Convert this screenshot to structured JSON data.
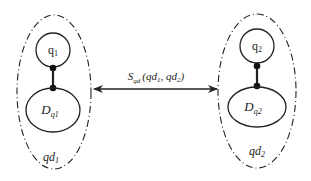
{
  "diagram": {
    "left_group": {
      "label_base": "qd",
      "label_sub": "1",
      "node_top": {
        "base": "q",
        "sub": "1"
      },
      "node_bottom": {
        "base": "D",
        "sub": "q1"
      }
    },
    "right_group": {
      "label_base": "qd",
      "label_sub": "2",
      "node_top": {
        "base": "q",
        "sub": "2"
      },
      "node_bottom": {
        "base": "D",
        "sub": "q2"
      }
    },
    "relation": {
      "symbol": "S",
      "symbol_sub": "qd",
      "args_open": "(qd",
      "arg1_sub": "1",
      "sep": ", qd",
      "arg2_sub": "2",
      "args_close": ")",
      "arrow": "bidirectional"
    },
    "colors": {
      "stroke": "#222222",
      "background": "#ffffff"
    }
  }
}
